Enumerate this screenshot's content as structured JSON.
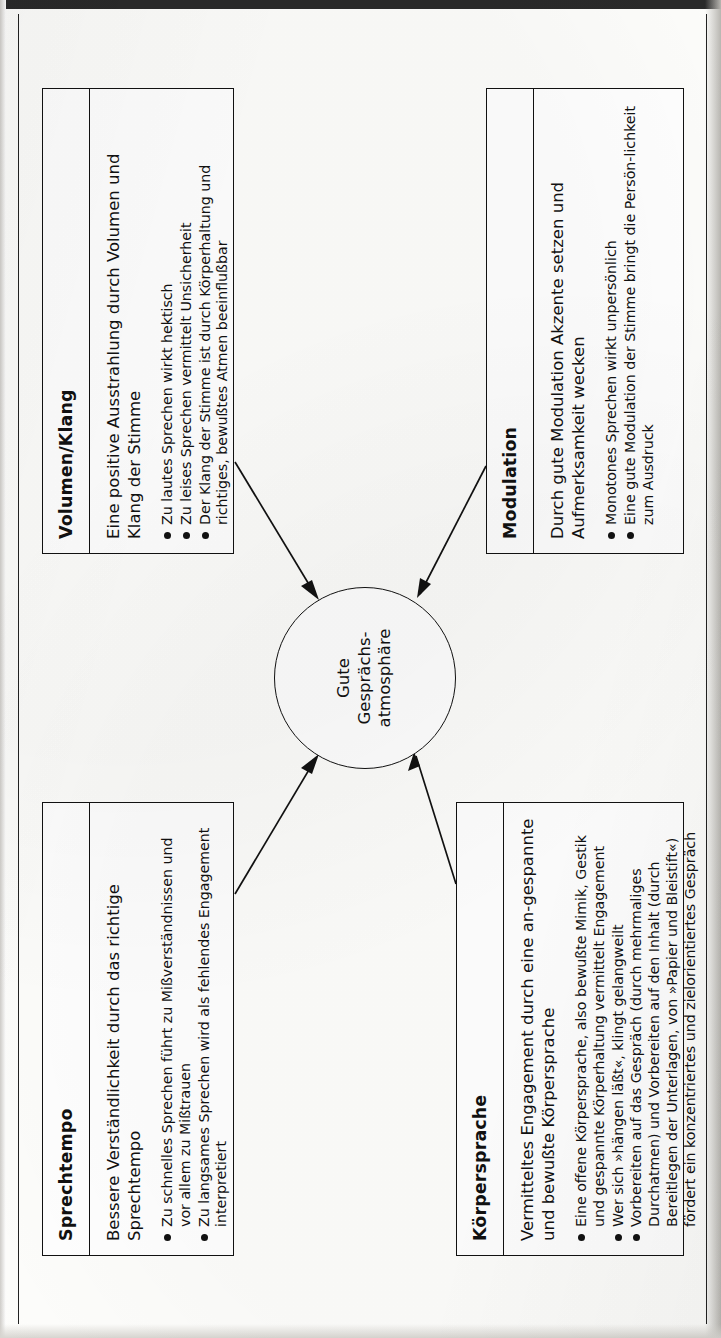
{
  "diagram": {
    "center": {
      "line1": "Gute",
      "line2": "Gesprächs-",
      "line3": "atmosphäre"
    },
    "boxes": [
      {
        "id": "sprechtempo",
        "title": "Sprechtempo",
        "lead": "Bessere Verständlichkeit durch das richtige Sprechtempo",
        "bullets": [
          "Zu schnelles Sprechen führt zu Mißverständnissen und vor allem zu Mißtrauen",
          "Zu langsames Sprechen wird als fehlendes Engagement interpretiert"
        ]
      },
      {
        "id": "volumen-klang",
        "title": "Volumen/Klang",
        "lead": "Eine positive Ausstrahlung durch Volumen und Klang der Stimme",
        "bullets": [
          "Zu lautes Sprechen wirkt hektisch",
          "Zu leises Sprechen vermittelt Unsicherheit",
          "Der Klang der Stimme ist durch Körperhaltung und richtiges, bewußtes Atmen beeinflußbar"
        ]
      },
      {
        "id": "koerpersprache",
        "title": "Körpersprache",
        "lead": "Vermitteltes Engagement durch eine an-gespannte und bewußte Körpersprache",
        "bullets": [
          "Eine offene Körpersprache, also bewußte Mimik, Gestik und gespannte Körperhaltung vermittelt Engagement",
          "Wer sich »hängen läßt«, klingt gelangweilt",
          "Vorbereiten auf das Gespräch (durch mehrmaliges Durchatmen) und Vorbereiten auf den Inhalt (durch Bereitlegen der Unterlagen, von »Papier und Bleistift«) fördert ein konzentriertes und zielorientiertes Gespräch"
        ]
      },
      {
        "id": "modulation",
        "title": "Modulation",
        "lead": "Durch gute Modulation Akzente setzen und Aufmerksamkeit wecken",
        "bullets": [
          "Monotones Sprechen wirkt unpersönlich",
          "Eine gute Modulation der Stimme bringt die Persön-lichkeit zum Ausdruck"
        ]
      }
    ]
  }
}
